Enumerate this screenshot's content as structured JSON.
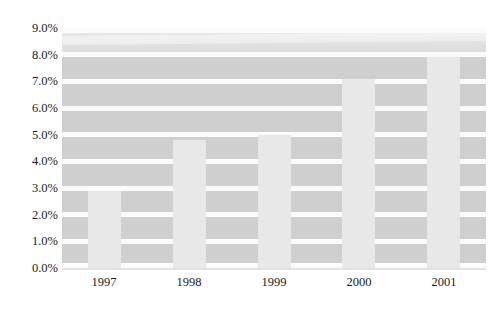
{
  "chart_data": {
    "type": "bar",
    "title": "",
    "subtitle": "",
    "xlabel": "",
    "ylabel": "",
    "categories": [
      "1997",
      "1998",
      "1999",
      "2000",
      "2001"
    ],
    "values": [
      2.9,
      4.8,
      5.0,
      7.1,
      7.9
    ],
    "value_suffix": "%",
    "ylim": [
      0.0,
      9.0
    ],
    "ytick_values": [
      0.0,
      1.0,
      2.0,
      3.0,
      4.0,
      5.0,
      6.0,
      7.0,
      8.0,
      9.0
    ],
    "ytick_labels": [
      "0.0%",
      "1.0%",
      "2.0%",
      "3.0%",
      "4.0%",
      "5.0%",
      "6.0%",
      "7.0%",
      "8.0%",
      "9.0%"
    ],
    "grid": true,
    "grid_orientation": "horizontal",
    "legend": null,
    "legend_position": "none",
    "annotations": [],
    "series": [
      {
        "name": "",
        "values": [
          2.9,
          4.8,
          5.0,
          7.1,
          7.9
        ]
      }
    ],
    "colors": {
      "bar_fill": "#e8e8e8",
      "plot_background": "#cfcfcf",
      "gridline": "#fbfbfb",
      "page_background": "#ffffff",
      "tick_label": "#1b1b1b"
    }
  }
}
